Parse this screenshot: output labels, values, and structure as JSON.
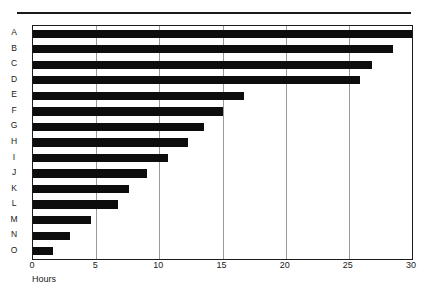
{
  "chart_data": {
    "type": "bar",
    "orientation": "horizontal",
    "title": "",
    "xlabel": "Hours",
    "ylabel": "",
    "xlim": [
      0,
      30
    ],
    "xticks": [
      0,
      5,
      10,
      15,
      20,
      25,
      30
    ],
    "xtick_labels": [
      "0",
      "5",
      "10",
      "15",
      "20",
      "25",
      "30"
    ],
    "grid": true,
    "grid_axis": "x",
    "legend": false,
    "categories": [
      "A",
      "B",
      "C",
      "D",
      "E",
      "F",
      "G",
      "H",
      "I",
      "J",
      "K",
      "L",
      "M",
      "N",
      "O"
    ],
    "values": [
      30.0,
      28.5,
      26.8,
      25.9,
      16.7,
      15.0,
      13.5,
      12.3,
      10.7,
      9.0,
      7.6,
      6.7,
      4.6,
      2.9,
      1.6
    ],
    "bar_color": "#0d0d0d",
    "grid_color": "#9a9a9a",
    "axis_color": "#1a1a1a",
    "background": "#ffffff"
  }
}
